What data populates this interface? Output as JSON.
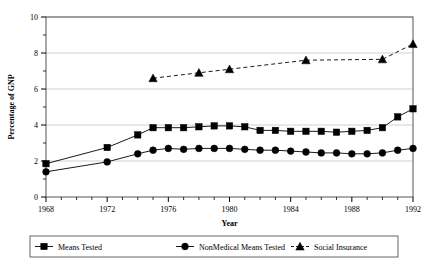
{
  "chart_data": {
    "type": "line",
    "title": "",
    "xlabel": "Year",
    "ylabel": "Percentage of GNP",
    "xlim": [
      1968,
      1992
    ],
    "ylim": [
      0,
      10
    ],
    "ytick_step": 2,
    "xtick_step": 4,
    "minor_ticks": true,
    "grid": true,
    "grid_axis": "y",
    "legend_position": "bottom",
    "x": [
      1968,
      1969,
      1970,
      1971,
      1972,
      1973,
      1974,
      1975,
      1976,
      1977,
      1978,
      1979,
      1980,
      1981,
      1982,
      1983,
      1984,
      1985,
      1986,
      1987,
      1988,
      1989,
      1990,
      1991,
      1992
    ],
    "xticklabels": [
      "1968",
      "1972",
      "1976",
      "1980",
      "1984",
      "1988",
      "1992"
    ],
    "xtickvalues": [
      1968,
      1972,
      1976,
      1980,
      1984,
      1988,
      1992
    ],
    "yticklabels": [
      "0",
      "2",
      "4",
      "6",
      "8",
      "10"
    ],
    "ytickvalues": [
      0,
      2,
      4,
      6,
      8,
      10
    ],
    "series": [
      {
        "name": "Means Tested",
        "marker": "square",
        "linestyle": "solid",
        "color": "#000000",
        "points": [
          {
            "x": 1968,
            "y": 1.85
          },
          {
            "x": 1972,
            "y": 2.75
          },
          {
            "x": 1974,
            "y": 3.45
          },
          {
            "x": 1975,
            "y": 3.85
          },
          {
            "x": 1976,
            "y": 3.85
          },
          {
            "x": 1977,
            "y": 3.85
          },
          {
            "x": 1978,
            "y": 3.9
          },
          {
            "x": 1979,
            "y": 3.95
          },
          {
            "x": 1980,
            "y": 3.95
          },
          {
            "x": 1981,
            "y": 3.9
          },
          {
            "x": 1982,
            "y": 3.7
          },
          {
            "x": 1983,
            "y": 3.7
          },
          {
            "x": 1984,
            "y": 3.65
          },
          {
            "x": 1985,
            "y": 3.65
          },
          {
            "x": 1986,
            "y": 3.65
          },
          {
            "x": 1987,
            "y": 3.6
          },
          {
            "x": 1988,
            "y": 3.65
          },
          {
            "x": 1989,
            "y": 3.7
          },
          {
            "x": 1990,
            "y": 3.85
          },
          {
            "x": 1991,
            "y": 4.45
          },
          {
            "x": 1992,
            "y": 4.9
          }
        ]
      },
      {
        "name": "NonMedical Means Tested",
        "marker": "circle",
        "linestyle": "solid",
        "color": "#000000",
        "points": [
          {
            "x": 1968,
            "y": 1.4
          },
          {
            "x": 1972,
            "y": 1.95
          },
          {
            "x": 1974,
            "y": 2.4
          },
          {
            "x": 1975,
            "y": 2.6
          },
          {
            "x": 1976,
            "y": 2.7
          },
          {
            "x": 1977,
            "y": 2.65
          },
          {
            "x": 1978,
            "y": 2.7
          },
          {
            "x": 1979,
            "y": 2.7
          },
          {
            "x": 1980,
            "y": 2.7
          },
          {
            "x": 1981,
            "y": 2.65
          },
          {
            "x": 1982,
            "y": 2.6
          },
          {
            "x": 1983,
            "y": 2.6
          },
          {
            "x": 1984,
            "y": 2.55
          },
          {
            "x": 1985,
            "y": 2.5
          },
          {
            "x": 1986,
            "y": 2.45
          },
          {
            "x": 1987,
            "y": 2.45
          },
          {
            "x": 1988,
            "y": 2.4
          },
          {
            "x": 1989,
            "y": 2.4
          },
          {
            "x": 1990,
            "y": 2.45
          },
          {
            "x": 1991,
            "y": 2.6
          },
          {
            "x": 1992,
            "y": 2.7
          }
        ]
      },
      {
        "name": "Social Insurance",
        "marker": "triangle",
        "linestyle": "dashed",
        "color": "#000000",
        "points": [
          {
            "x": 1975,
            "y": 6.6
          },
          {
            "x": 1978,
            "y": 6.9
          },
          {
            "x": 1980,
            "y": 7.1
          },
          {
            "x": 1985,
            "y": 7.6
          },
          {
            "x": 1990,
            "y": 7.65
          },
          {
            "x": 1992,
            "y": 8.5
          }
        ]
      }
    ]
  }
}
